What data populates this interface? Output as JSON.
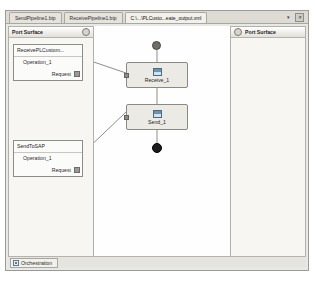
{
  "window": {
    "tabs": [
      {
        "label": "SendPipeline1.btp",
        "active": false
      },
      {
        "label": "ReceivePipeline1.btp",
        "active": false
      },
      {
        "label": "C:\\...\\PLCusto...eate_output.xml",
        "active": true
      }
    ],
    "buttons": {
      "dropdown_icon": "chevron-down-icon",
      "close_icon": "close-icon",
      "close_glyph": "✕",
      "dropdown_glyph": "▾"
    }
  },
  "left_panel": {
    "header": "Port Surface",
    "header_icon": "collapse-icon",
    "ports": [
      {
        "title": "ReceivePLCustom...",
        "operation": "Operation_1",
        "message": "Request"
      },
      {
        "title": "SendToSAP",
        "operation": "Operation_1",
        "message": "Request"
      }
    ]
  },
  "right_panel": {
    "header": "Port Surface",
    "header_icon": "collapse-icon"
  },
  "canvas": {
    "start_node": "start-shape",
    "end_node": "end-shape",
    "shapes": [
      {
        "label": "Receive_1",
        "icon": "receive-shape-icon"
      },
      {
        "label": "Send_1",
        "icon": "send-shape-icon"
      }
    ]
  },
  "bottom": {
    "tab_label": "Orchestration",
    "tab_icon": "orchestration-icon"
  },
  "colors": {
    "window_bg": "#e8e8e6",
    "canvas_bg": "#fefefe",
    "panel_bg": "#f3f2ee",
    "shape_bg": "#eceae4",
    "border": "#8a8984",
    "end_node": "#1c1c1c"
  }
}
